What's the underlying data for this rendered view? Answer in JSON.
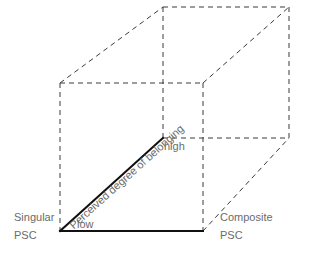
{
  "diagram": {
    "type": "cube-axes",
    "labels": {
      "singular_line1": "Singular",
      "singular_line2": "PSC",
      "composite_line1": "Composite",
      "composite_line2": "PSC",
      "axis_label": "Perceived degree of belonging",
      "low": "low",
      "high": "high"
    },
    "colors": {
      "dashed_edges": "#3a3a3a",
      "solid_axes": "#111111",
      "text": "#6b6b6b",
      "background": "#ffffff"
    },
    "vertices": {
      "front_top_left": [
        60,
        83
      ],
      "front_top_right": [
        203,
        83
      ],
      "front_bottom_left": [
        60,
        231
      ],
      "front_bottom_right": [
        203,
        231
      ],
      "back_top_left": [
        163,
        7
      ],
      "back_top_right": [
        289,
        7
      ],
      "back_bottom_left": [
        163,
        138
      ],
      "back_bottom_right": [
        289,
        138
      ]
    }
  }
}
